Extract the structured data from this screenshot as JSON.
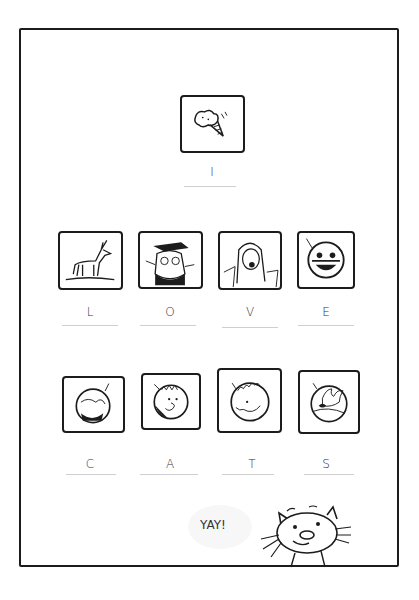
{
  "puzzle": {
    "title_word": {
      "icon": "ice-cream-cone-icon",
      "letter": "I"
    },
    "row_love": [
      {
        "icon": "deer-icon",
        "letter": "L"
      },
      {
        "icon": "owl-graduate-icon",
        "letter": "O"
      },
      {
        "icon": "screaming-woman-icon",
        "letter": "V"
      },
      {
        "icon": "masked-face-badge-icon",
        "letter": "E"
      }
    ],
    "row_cats": [
      {
        "icon": "portrait-badge-icon",
        "letter": "C"
      },
      {
        "icon": "boy-face-badge-icon",
        "letter": "A"
      },
      {
        "icon": "curly-hair-badge-icon",
        "letter": "T"
      },
      {
        "icon": "bird-badge-icon",
        "letter": "S"
      }
    ]
  },
  "footer": {
    "speech": "YAY!",
    "character": "smiling-cat-icon"
  },
  "colors": {
    "ink": "#1c1c1c",
    "underline": "#cfcfcf",
    "bubble": "#f7f7f7"
  }
}
